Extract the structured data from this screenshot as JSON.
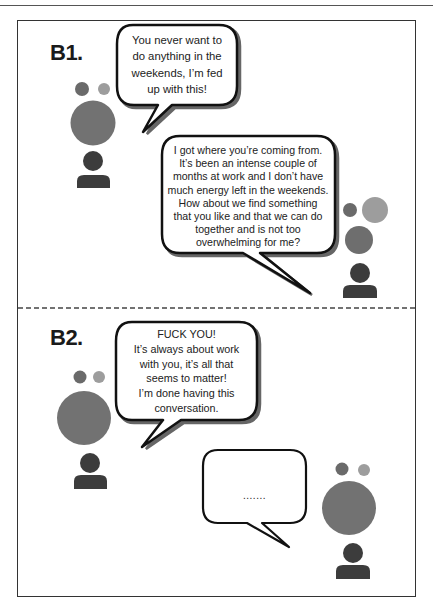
{
  "page": {
    "header_text": "",
    "panels": [
      {
        "label": "B1.",
        "bubbles": [
          {
            "speaker": "left",
            "lines": [
              "You never want to",
              "do anything in the",
              "weekends, I’m fed",
              "up with this!"
            ]
          },
          {
            "speaker": "right",
            "lines": [
              "I got where you’re coming from.",
              "It’s been an intense couple of",
              "months at work and I don’t have",
              "much energy left in the weekends.",
              "How about we find something",
              "that you like and that we can do",
              "together and is not too",
              "overwhelming for me?"
            ]
          }
        ]
      },
      {
        "label": "B2.",
        "bubbles": [
          {
            "speaker": "left",
            "lines": [
              "FUCK YOU!",
              "It’s always about work",
              "with you, it’s all that",
              "seems to matter!",
              "I’m done having this",
              "conversation."
            ]
          },
          {
            "speaker": "right",
            "lines": [
              "......."
            ]
          }
        ]
      }
    ],
    "colors": {
      "frame": "#333333",
      "bubble_stroke": "#111111",
      "bubble_shadow": "#555555",
      "emotion_dark": "#6a6a6a",
      "emotion_light": "#9d9d9d",
      "emotion_big": "#727272",
      "person": "#3c3c3c"
    }
  }
}
